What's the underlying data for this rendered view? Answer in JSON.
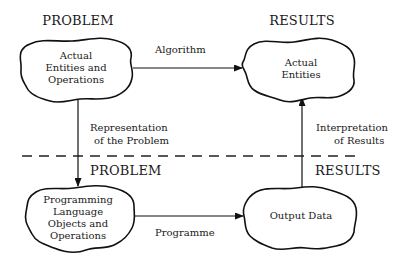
{
  "diagram": {
    "headers": {
      "problem_top": "PROBLEM",
      "results_top": "RESULTS",
      "problem_bottom": "PROBLEM",
      "results_bottom": "RESULTS"
    },
    "nodes": {
      "actual_problem": {
        "lines": [
          "Actual",
          "Entities and",
          "Operations"
        ]
      },
      "actual_results": {
        "lines": [
          "Actual",
          "Entities"
        ]
      },
      "programming_objects": {
        "lines": [
          "Programming",
          "Language",
          "Objects and",
          "Operations"
        ]
      },
      "output_data": {
        "lines": [
          "Output Data"
        ]
      }
    },
    "edges": {
      "algorithm": {
        "label": "Algorithm"
      },
      "representation": {
        "lines": [
          "Representation",
          "of the Problem"
        ]
      },
      "programme": {
        "label": "Programme"
      },
      "interpretation": {
        "lines": [
          "Interpretation",
          "of Results"
        ]
      }
    },
    "divider": {
      "style": "dashed"
    }
  }
}
